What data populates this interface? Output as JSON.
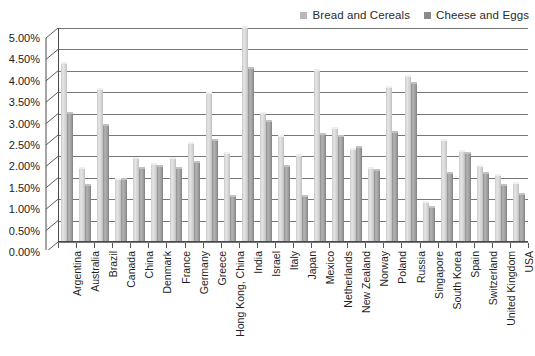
{
  "chart_data": {
    "type": "bar",
    "title": "",
    "subtitle": "",
    "xlabel": "",
    "ylabel": "",
    "ylim": [
      0,
      5.0
    ],
    "yticks": [
      "0.00%",
      "0.50%",
      "1.00%",
      "1.50%",
      "2.00%",
      "2.50%",
      "3.00%",
      "3.50%",
      "4.00%",
      "4.50%",
      "5.00%"
    ],
    "ytick_values": [
      0,
      0.5,
      1.0,
      1.5,
      2.0,
      2.5,
      3.0,
      3.5,
      4.0,
      4.5,
      5.0
    ],
    "grid": true,
    "legend_position": "top-right",
    "categories": [
      "Argentina",
      "Australia",
      "Brazil",
      "Canada",
      "China",
      "Denmark",
      "France",
      "Germany",
      "Greece",
      "Hong Kong, China",
      "India",
      "Israel",
      "Italy",
      "Japan",
      "Mexico",
      "Netherlands",
      "New Zealand",
      "Norway",
      "Poland",
      "Russia",
      "Singapore",
      "South Korea",
      "Spain",
      "Switzerland",
      "United Kingdom",
      "USA"
    ],
    "series": [
      {
        "name": "Bread and Cereals",
        "color": "#d9d9d9",
        "values": [
          4.15,
          1.7,
          3.55,
          1.45,
          1.95,
          1.8,
          1.95,
          2.3,
          3.45,
          2.05,
          5.05,
          3.0,
          2.45,
          2.0,
          4.0,
          2.65,
          2.15,
          1.7,
          3.6,
          3.85,
          0.9,
          2.35,
          2.1,
          1.75,
          1.55,
          1.35
        ],
        "unit": "%"
      },
      {
        "name": "Cheese and Eggs",
        "color": "#9a9a9a",
        "values": [
          3.0,
          1.3,
          2.7,
          1.45,
          1.7,
          1.75,
          1.7,
          1.85,
          2.35,
          1.05,
          4.05,
          2.8,
          1.75,
          1.05,
          2.5,
          2.45,
          2.2,
          1.65,
          2.55,
          3.7,
          0.8,
          1.6,
          2.05,
          1.6,
          1.3,
          1.1
        ],
        "unit": "%"
      }
    ]
  },
  "legend": {
    "entries": [
      {
        "label": "Bread and Cereals",
        "swatch_color": "#b9b9b9"
      },
      {
        "label": "Cheese and Eggs",
        "swatch_color": "#8a8a8a"
      }
    ]
  }
}
